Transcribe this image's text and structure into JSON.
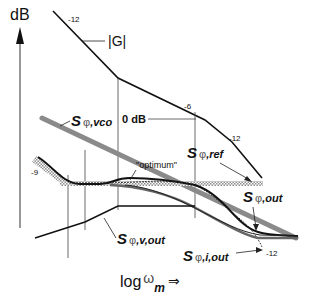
{
  "diagram": {
    "type": "bode-asymptotic-phase-noise",
    "y_axis": {
      "label": "dB",
      "direction": "up"
    },
    "x_axis": {
      "label_base": "log",
      "label_symbol": "ω",
      "label_sub": "m",
      "arrow": "⇒"
    },
    "open_loop_gain": {
      "label": "|G|",
      "slopes": [
        "-12",
        "-6",
        "-12"
      ],
      "zero_db_label": "0 dB"
    },
    "curves": {
      "vco": {
        "label_S": "S",
        "label_phi": "φ",
        "label_sub": ",vco",
        "color": "#8a8a8a"
      },
      "ref": {
        "label_S": "S",
        "label_phi": "φ",
        "label_sub": ",ref",
        "style": "hatched"
      },
      "out": {
        "label_S": "S",
        "label_phi": "φ",
        "label_sub": ",out",
        "color": "#111111"
      },
      "v_out": {
        "label_S": "S",
        "label_phi": "φ",
        "label_sub": ",v,out",
        "color": "#111111"
      },
      "i_out": {
        "label_S": "S",
        "label_phi": "φ",
        "label_sub": ",i,out",
        "style": "dotted",
        "slope": "-12"
      }
    },
    "annotations": {
      "optimum": "\"optimum\"",
      "left_slope": "-9"
    },
    "colors": {
      "line": "#111111",
      "vco": "#8a8a8a",
      "hatch": "#9a9a9a",
      "thin": "#333333"
    }
  }
}
